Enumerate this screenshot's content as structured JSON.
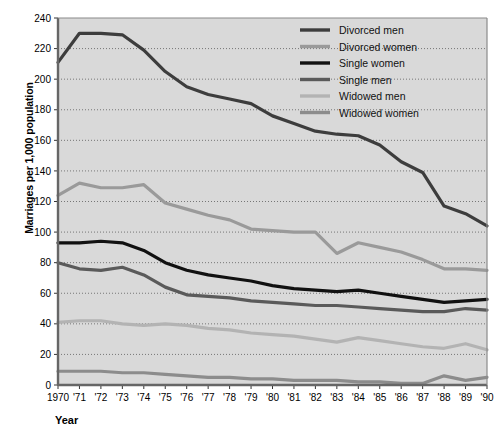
{
  "chart_data": {
    "type": "line",
    "title": "",
    "xlabel": "Year",
    "ylabel": "Marriages per 1,000 population",
    "xlim": [
      1970,
      1990
    ],
    "ylim": [
      0,
      240
    ],
    "ytick_step": 20,
    "grid": true,
    "legend_position": "top-right",
    "x": [
      1970,
      1971,
      1972,
      1973,
      1974,
      1975,
      1976,
      1977,
      1978,
      1979,
      1980,
      1981,
      1982,
      1983,
      1984,
      1985,
      1986,
      1987,
      1988,
      1989,
      1990
    ],
    "xtick_labels": [
      "1970",
      "'71",
      "'72",
      "'73",
      "'74",
      "'75",
      "'76",
      "'77",
      "'78",
      "'79",
      "'80",
      "'81",
      "'82",
      "'83",
      "'84",
      "'85",
      "'86",
      "'87",
      "'88",
      "'89",
      "'90"
    ],
    "ytick_labels": [
      "0",
      "20",
      "40",
      "60",
      "80",
      "100",
      "120",
      "140",
      "160",
      "180",
      "200",
      "220",
      "240"
    ],
    "series": [
      {
        "name": "Divorced men",
        "color": "#3d3d3d",
        "width": 3.2,
        "values": [
          211,
          230,
          230,
          229,
          219,
          205,
          195,
          190,
          187,
          184,
          176,
          171,
          166,
          164,
          163,
          157,
          146,
          139,
          117,
          112,
          104
        ]
      },
      {
        "name": "Divorced women",
        "color": "#9a9a9a",
        "width": 3.2,
        "values": [
          124,
          132,
          129,
          129,
          131,
          119,
          115,
          111,
          108,
          102,
          101,
          100,
          100,
          86,
          93,
          90,
          87,
          82,
          76,
          76,
          75
        ]
      },
      {
        "name": "Single women",
        "color": "#111111",
        "width": 3.2,
        "values": [
          93,
          93,
          94,
          93,
          88,
          80,
          75,
          72,
          70,
          68,
          65,
          63,
          62,
          61,
          62,
          60,
          58,
          56,
          54,
          55,
          56
        ]
      },
      {
        "name": "Single men",
        "color": "#5a5a5a",
        "width": 3.2,
        "values": [
          80,
          76,
          75,
          77,
          72,
          64,
          59,
          58,
          57,
          55,
          54,
          53,
          52,
          52,
          51,
          50,
          49,
          48,
          48,
          50,
          49
        ]
      },
      {
        "name": "Widowed men",
        "color": "#b3b3b3",
        "width": 3.2,
        "values": [
          41,
          42,
          42,
          40,
          39,
          40,
          39,
          37,
          36,
          34,
          33,
          32,
          30,
          28,
          31,
          29,
          27,
          25,
          24,
          27,
          23
        ]
      },
      {
        "name": "Widowed women",
        "color": "#8c8c8c",
        "width": 3.2,
        "values": [
          9,
          9,
          9,
          8,
          8,
          7,
          6,
          5,
          5,
          4,
          4,
          3,
          3,
          3,
          2,
          2,
          1,
          1,
          6,
          3,
          5
        ]
      }
    ],
    "legend": [
      {
        "label": "Divorced men",
        "color": "#3d3d3d"
      },
      {
        "label": "Divorced women",
        "color": "#9a9a9a"
      },
      {
        "label": "Single women",
        "color": "#111111"
      },
      {
        "label": "Single men",
        "color": "#5a5a5a"
      },
      {
        "label": "Widowed men",
        "color": "#b3b3b3"
      },
      {
        "label": "Widowed women",
        "color": "#8c8c8c"
      }
    ],
    "plot_bg": "#d9d9d9",
    "grid_color": "#6b6b6b",
    "axis_color": "#555555"
  }
}
